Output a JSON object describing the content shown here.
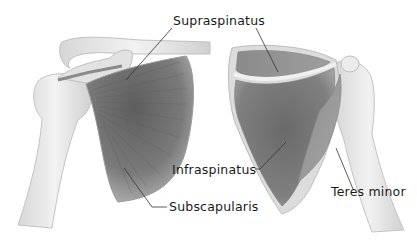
{
  "diagram": {
    "type": "anatomical-illustration",
    "views": [
      "anterior",
      "posterior"
    ],
    "colors": {
      "background": "#ffffff",
      "bone": "#e8e8e8",
      "bone_outline": "#b8b8b8",
      "muscle_dark": "#6e6e6e",
      "muscle_light": "#a8a8a8",
      "leader_line": "#333333",
      "label_text": "#1a1a1a"
    },
    "labels": [
      {
        "id": "supraspinatus",
        "text": "Supraspinatus",
        "x": 173,
        "y": 14
      },
      {
        "id": "infraspinatus",
        "text": "Infraspinatus",
        "x": 174,
        "y": 163
      },
      {
        "id": "subscapularis",
        "text": "Subscapularis",
        "x": 169,
        "y": 200
      },
      {
        "id": "teres-minor",
        "text": "Teres minor",
        "x": 331,
        "y": 185
      }
    ]
  }
}
